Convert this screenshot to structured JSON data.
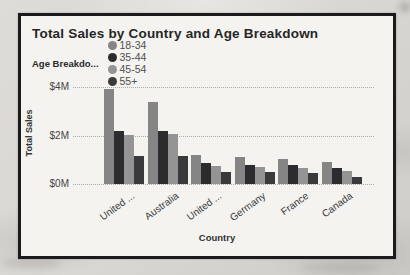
{
  "page": {
    "background_hex": "#d8d6d2"
  },
  "card": {
    "border_hex": "#1b1b1b",
    "background_hex": "#f4f3f0"
  },
  "chart_data": {
    "type": "bar",
    "title": "Total Sales by Country and Age Breakdown",
    "legend_title": "Age Breakdo...",
    "legend_position": "top",
    "xlabel": "Country",
    "ylabel": "Total Sales",
    "units": "$M",
    "ylim": [
      0,
      4
    ],
    "grid": "dotted-horizontal",
    "yticks": [
      {
        "label": "$0M",
        "value": 0
      },
      {
        "label": "$2M",
        "value": 2
      },
      {
        "label": "$4M",
        "value": 4
      }
    ],
    "categories": [
      "United ...",
      "Australia",
      "United ...",
      "Germany",
      "France",
      "Canada"
    ],
    "series": [
      {
        "name": "18-34",
        "color": "#858585",
        "values": [
          3.9,
          3.4,
          1.2,
          1.1,
          1.05,
          0.9
        ]
      },
      {
        "name": "35-44",
        "color": "#2c2c2e",
        "values": [
          2.2,
          2.2,
          0.85,
          0.8,
          0.78,
          0.65
        ]
      },
      {
        "name": "45-54",
        "color": "#949494",
        "values": [
          2.0,
          2.05,
          0.75,
          0.7,
          0.65,
          0.55
        ]
      },
      {
        "name": "55+",
        "color": "#3a3a3c",
        "values": [
          1.15,
          1.15,
          0.5,
          0.5,
          0.45,
          0.3
        ]
      }
    ]
  }
}
